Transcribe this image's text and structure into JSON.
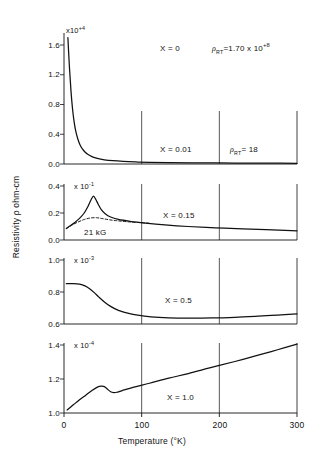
{
  "figure": {
    "y_axis_title": "Resistivity ρ ohm-cm",
    "x_axis_title": "Temperature (°K)"
  },
  "chart_data": {
    "type": "line",
    "title": "",
    "xlabel": "Temperature (°K)",
    "ylabel": "Resistivity ρ ohm-cm",
    "xlim": [
      0,
      300
    ],
    "xticks": [
      0,
      100,
      200,
      300
    ],
    "xticklabels": [
      "0",
      "100",
      "200",
      "300"
    ],
    "grid": "vertical gridlines at 100 and 200 in every panel",
    "legend": "none",
    "panels": [
      {
        "id": "panel-1",
        "composition_label": "X = 0",
        "rho_rt_label": "ρRT = 1.70 x 10+8",
        "rho_rt_mantissa": "1.70",
        "rho_rt_exponent": "+8",
        "secondary_composition_label": "X = 0.01",
        "secondary_rho_rt_label": "ρRT = 18",
        "exponent_label": "x10+4",
        "exponent": "+4",
        "ylim": [
          0.0,
          1.8
        ],
        "yticks": [
          0.0,
          0.4,
          0.8,
          1.2,
          1.6
        ],
        "yticklabels": [
          "0.0",
          "0.4",
          "0.8",
          "1.2",
          "1.6"
        ],
        "series": [
          {
            "name": "X = 0",
            "style": "solid",
            "x": [
              5,
              7,
              9,
              11,
              13,
              15,
              18,
              21,
              25,
              30,
              36,
              43,
              52,
              63,
              76,
              92,
              110,
              135,
              165,
              200,
              240,
              275,
              300
            ],
            "y": [
              1.7,
              1.3,
              0.98,
              0.74,
              0.57,
              0.45,
              0.33,
              0.25,
              0.185,
              0.135,
              0.1,
              0.075,
              0.057,
              0.044,
              0.035,
              0.028,
              0.023,
              0.019,
              0.016,
              0.014,
              0.012,
              0.011,
              0.01
            ]
          }
        ]
      },
      {
        "id": "panel-2",
        "composition_label": "X = 0.15",
        "field_label": "21 kG",
        "exponent_label": "x 10-1",
        "exponent": "-1",
        "ylim": [
          0.0,
          0.42
        ],
        "yticks": [
          0.0,
          0.2,
          0.4
        ],
        "yticklabels": [
          "0.0",
          "0.2",
          "0.4"
        ],
        "series": [
          {
            "name": "zero field",
            "style": "solid",
            "x": [
              3,
              8,
              14,
              20,
              26,
              31,
              35,
              38,
              41,
              44,
              48,
              53,
              60,
              70,
              85,
              105,
              130,
              160,
              195,
              230,
              260,
              285,
              300
            ],
            "y": [
              0.085,
              0.105,
              0.13,
              0.16,
              0.2,
              0.25,
              0.3,
              0.325,
              0.3,
              0.265,
              0.225,
              0.195,
              0.17,
              0.152,
              0.138,
              0.125,
              0.112,
              0.1,
              0.09,
              0.082,
              0.076,
              0.071,
              0.068
            ]
          },
          {
            "name": "21 kG",
            "style": "dashed",
            "x": [
              3,
              10,
              18,
              26,
              34,
              42,
              50,
              58,
              68,
              80,
              95,
              110
            ],
            "y": [
              0.085,
              0.11,
              0.133,
              0.152,
              0.163,
              0.165,
              0.158,
              0.15,
              0.143,
              0.136,
              0.13,
              0.124
            ]
          }
        ]
      },
      {
        "id": "panel-3",
        "composition_label": "X = 0.5",
        "exponent_label": "x 10-3",
        "exponent": "-3",
        "ylim": [
          0.58,
          1.04
        ],
        "yticks": [
          0.6,
          0.8,
          1.0
        ],
        "yticklabels": [
          "0.6",
          "0.8",
          "1.0"
        ],
        "series": [
          {
            "name": "X = 0.5",
            "style": "solid",
            "x": [
              3,
              12,
              20,
              27,
              33,
              39,
              45,
              52,
              60,
              70,
              82,
              95,
              112,
              135,
              160,
              190,
              220,
              250,
              275,
              300
            ],
            "y": [
              0.852,
              0.853,
              0.849,
              0.838,
              0.82,
              0.796,
              0.768,
              0.738,
              0.71,
              0.685,
              0.668,
              0.655,
              0.645,
              0.639,
              0.637,
              0.638,
              0.642,
              0.649,
              0.656,
              0.663
            ]
          }
        ]
      },
      {
        "id": "panel-4",
        "composition_label": "X = 1.0",
        "exponent_label": "x 10-4",
        "exponent": "-4",
        "ylim": [
          0.97,
          1.47
        ],
        "yticks": [
          1.0,
          1.2,
          1.4
        ],
        "yticklabels": [
          "1.0",
          "1.2",
          "1.4"
        ],
        "series": [
          {
            "name": "X = 1.0",
            "style": "solid",
            "x": [
              4,
              12,
              20,
              28,
              36,
              43,
              48,
              52,
              56,
              60,
              64,
              68,
              75,
              90,
              110,
              135,
              160,
              190,
              220,
              250,
              275,
              300
            ],
            "y": [
              1.018,
              1.048,
              1.078,
              1.105,
              1.132,
              1.152,
              1.158,
              1.155,
              1.14,
              1.125,
              1.12,
              1.122,
              1.132,
              1.152,
              1.175,
              1.205,
              1.232,
              1.268,
              1.303,
              1.34,
              1.372,
              1.405
            ]
          }
        ]
      }
    ]
  }
}
